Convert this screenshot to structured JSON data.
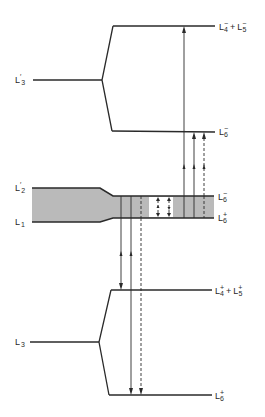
{
  "diagram": {
    "type": "energy-level-transition-diagram",
    "colors": {
      "line": "#2a2a2a",
      "band_fill": "#bababa",
      "background": "#ffffff"
    },
    "labels": {
      "left": [
        {
          "id": "l3_prime",
          "base": "L",
          "prime": "′",
          "sub": "3"
        },
        {
          "id": "l2_prime",
          "base": "L",
          "prime": "′",
          "sub": "2"
        },
        {
          "id": "l1",
          "base": "L",
          "sub": "1"
        },
        {
          "id": "l3",
          "base": "L",
          "sub": "3"
        }
      ],
      "right": [
        {
          "id": "l4m_l5m",
          "terms": [
            {
              "base": "L",
              "sup": "−",
              "sub": "4"
            },
            {
              "base": "L",
              "sup": "−",
              "sub": "5"
            }
          ],
          "join": "+"
        },
        {
          "id": "l6m_upper",
          "terms": [
            {
              "base": "L",
              "sup": "−",
              "sub": "6"
            }
          ]
        },
        {
          "id": "l6m_band",
          "terms": [
            {
              "base": "L",
              "sup": "−",
              "sub": "6"
            }
          ]
        },
        {
          "id": "l6p_band",
          "terms": [
            {
              "base": "L",
              "sup": "+",
              "sub": "6"
            }
          ]
        },
        {
          "id": "l4p_l5p",
          "terms": [
            {
              "base": "L",
              "sup": "+",
              "sub": "4"
            },
            {
              "base": "L",
              "sup": "+",
              "sub": "5"
            }
          ],
          "join": "+"
        },
        {
          "id": "l6p_lower",
          "terms": [
            {
              "base": "L",
              "sup": "+",
              "sub": "6"
            }
          ]
        }
      ]
    },
    "levels": [
      {
        "name": "L'3",
        "splits_into": [
          "L4- + L5-",
          "L6-"
        ]
      },
      {
        "name": "L'2 / L1 band",
        "narrows_to": [
          "L6-",
          "L6+"
        ]
      },
      {
        "name": "L3",
        "splits_into": [
          "L4+ + L5+",
          "L6+"
        ]
      }
    ],
    "transitions": [
      {
        "from": "band",
        "to": "L4- + L5-",
        "style": "solid",
        "direction": "up"
      },
      {
        "from": "band",
        "to": "L6- (upper)",
        "style": "solid",
        "direction": "up"
      },
      {
        "from": "band",
        "to": "L6- (upper)",
        "style": "dashed",
        "direction": "up"
      },
      {
        "from": "band",
        "to": "L4+ + L5+",
        "style": "solid",
        "direction": "down"
      },
      {
        "from": "band",
        "to": "L6+ (lower)",
        "style": "solid",
        "direction": "down"
      },
      {
        "from": "band",
        "to": "L6+ (lower)",
        "style": "dashed",
        "direction": "down"
      },
      {
        "from": "L6+ (band)",
        "to": "L6- (band)",
        "style": "dashed",
        "direction": "both"
      },
      {
        "from": "L6+ (band)",
        "to": "L6- (band)",
        "style": "dashed",
        "direction": "both"
      }
    ]
  }
}
